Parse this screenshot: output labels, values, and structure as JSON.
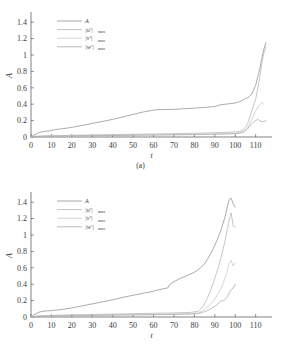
{
  "figure": {
    "panels": [
      {
        "caption": "(a)",
        "xlabel": "t",
        "ylabel": "A"
      },
      {
        "caption": "(b)",
        "xlabel": "t",
        "ylabel": "A"
      }
    ]
  },
  "chart_data": [
    {
      "type": "line",
      "panel": "(a)",
      "title": "",
      "xlabel": "t",
      "ylabel": "A",
      "xlim": [
        0,
        118
      ],
      "ylim": [
        0,
        1.5
      ],
      "xticks": [
        0,
        10,
        20,
        30,
        40,
        50,
        60,
        70,
        80,
        90,
        100,
        110
      ],
      "yticks": [
        0,
        0.2,
        0.4,
        0.6,
        0.8,
        1,
        1.2,
        1.4
      ],
      "xticklabels": [
        "0",
        "10",
        "20",
        "30",
        "40",
        "50",
        "60",
        "70",
        "80",
        "90",
        "100",
        "110"
      ],
      "yticklabels": [
        "0",
        "0.2",
        "0.4",
        "0.6",
        "0.8",
        "1",
        "1.2",
        "1.4"
      ],
      "grid": false,
      "legend_position": "upper-left",
      "series": [
        {
          "name": "A",
          "color": "#8f8f8f",
          "x": [
            0,
            2,
            4,
            6,
            8,
            10,
            12,
            15,
            18,
            20,
            25,
            30,
            35,
            40,
            45,
            50,
            55,
            60,
            62,
            65,
            70,
            75,
            80,
            85,
            90,
            93,
            95,
            97,
            100,
            102,
            104,
            105,
            106,
            108,
            110,
            112,
            113,
            114,
            115
          ],
          "y": [
            0.0,
            0.03,
            0.055,
            0.065,
            0.072,
            0.08,
            0.09,
            0.1,
            0.11,
            0.118,
            0.14,
            0.165,
            0.19,
            0.215,
            0.245,
            0.275,
            0.305,
            0.328,
            0.333,
            0.335,
            0.337,
            0.345,
            0.352,
            0.36,
            0.372,
            0.395,
            0.4,
            0.405,
            0.415,
            0.43,
            0.455,
            0.47,
            0.475,
            0.52,
            0.63,
            0.83,
            0.96,
            1.07,
            1.15
          ]
        },
        {
          "name": "|u'|max",
          "color": "#b4b4b4",
          "x": [
            0,
            2,
            5,
            10,
            15,
            20,
            30,
            40,
            50,
            60,
            70,
            80,
            90,
            95,
            100,
            102,
            104,
            105,
            106,
            108,
            110,
            112,
            113,
            114,
            115
          ],
          "y": [
            0.0,
            0.008,
            0.012,
            0.016,
            0.019,
            0.021,
            0.025,
            0.029,
            0.033,
            0.037,
            0.041,
            0.046,
            0.052,
            0.056,
            0.062,
            0.068,
            0.09,
            0.12,
            0.16,
            0.31,
            0.46,
            0.72,
            0.9,
            1.02,
            1.1
          ]
        },
        {
          "name": "|v'|max",
          "color": "#c8c8c8",
          "x": [
            0,
            2,
            5,
            10,
            15,
            20,
            30,
            40,
            50,
            60,
            70,
            80,
            90,
            95,
            100,
            102,
            104,
            105,
            106,
            108,
            110,
            112,
            113,
            114
          ],
          "y": [
            0.0,
            0.006,
            0.009,
            0.012,
            0.014,
            0.016,
            0.019,
            0.022,
            0.025,
            0.028,
            0.031,
            0.035,
            0.04,
            0.043,
            0.048,
            0.053,
            0.07,
            0.085,
            0.11,
            0.21,
            0.32,
            0.39,
            0.42,
            0.4
          ]
        },
        {
          "name": "|w'|max",
          "color": "#a8a8a8",
          "x": [
            0,
            2,
            5,
            10,
            15,
            20,
            30,
            40,
            50,
            60,
            70,
            80,
            90,
            95,
            100,
            102,
            104,
            105,
            106,
            107,
            108,
            109,
            110,
            111,
            112,
            113,
            114,
            115
          ],
          "y": [
            0.0,
            0.005,
            0.008,
            0.01,
            0.012,
            0.013,
            0.016,
            0.018,
            0.021,
            0.023,
            0.026,
            0.029,
            0.033,
            0.036,
            0.04,
            0.045,
            0.06,
            0.075,
            0.1,
            0.13,
            0.16,
            0.185,
            0.2,
            0.215,
            0.2,
            0.185,
            0.19,
            0.2
          ]
        }
      ]
    },
    {
      "type": "line",
      "panel": "(b)",
      "title": "",
      "xlabel": "t",
      "ylabel": "A",
      "xlim": [
        0,
        118
      ],
      "ylim": [
        0,
        1.5
      ],
      "xticks": [
        0,
        10,
        20,
        30,
        40,
        50,
        60,
        70,
        80,
        90,
        100,
        110
      ],
      "yticks": [
        0,
        0.2,
        0.4,
        0.6,
        0.8,
        1,
        1.2,
        1.4
      ],
      "xticklabels": [
        "0",
        "10",
        "20",
        "30",
        "40",
        "50",
        "60",
        "70",
        "80",
        "90",
        "100",
        "110"
      ],
      "yticklabels": [
        "0",
        "0.2",
        "0.4",
        "0.6",
        "0.8",
        "1",
        "1.2",
        "1.4"
      ],
      "grid": false,
      "legend_position": "upper-left",
      "series": [
        {
          "name": "A",
          "color": "#8f8f8f",
          "x": [
            0,
            2,
            4,
            6,
            8,
            10,
            13,
            16,
            20,
            25,
            30,
            35,
            40,
            45,
            50,
            55,
            60,
            63,
            65,
            67,
            68,
            70,
            73,
            76,
            80,
            83,
            85,
            87,
            89,
            91,
            93,
            95,
            96,
            97,
            98,
            99,
            100
          ],
          "y": [
            0.0,
            0.035,
            0.06,
            0.07,
            0.075,
            0.078,
            0.085,
            0.095,
            0.11,
            0.135,
            0.16,
            0.185,
            0.21,
            0.24,
            0.265,
            0.29,
            0.315,
            0.335,
            0.345,
            0.355,
            0.4,
            0.43,
            0.47,
            0.5,
            0.545,
            0.6,
            0.65,
            0.73,
            0.82,
            0.93,
            1.06,
            1.22,
            1.33,
            1.43,
            1.45,
            1.38,
            1.34
          ]
        },
        {
          "name": "|u'|max",
          "color": "#b4b4b4",
          "x": [
            0,
            3,
            6,
            10,
            15,
            20,
            30,
            40,
            50,
            60,
            70,
            78,
            82,
            84,
            86,
            88,
            90,
            92,
            94,
            95,
            96,
            97,
            98,
            99,
            100
          ],
          "y": [
            0.0,
            0.012,
            0.016,
            0.02,
            0.023,
            0.026,
            0.031,
            0.036,
            0.04,
            0.045,
            0.05,
            0.056,
            0.07,
            0.12,
            0.21,
            0.33,
            0.47,
            0.63,
            0.82,
            0.93,
            1.05,
            1.18,
            1.27,
            1.11,
            1.1
          ]
        },
        {
          "name": "|v'|max",
          "color": "#c8c8c8",
          "x": [
            0,
            3,
            6,
            10,
            15,
            20,
            30,
            40,
            50,
            60,
            70,
            78,
            82,
            84,
            86,
            88,
            90,
            92,
            93,
            94,
            95,
            96,
            97,
            98,
            99,
            100
          ],
          "y": [
            0.0,
            0.009,
            0.012,
            0.015,
            0.018,
            0.02,
            0.024,
            0.027,
            0.031,
            0.034,
            0.038,
            0.043,
            0.05,
            0.075,
            0.11,
            0.16,
            0.22,
            0.3,
            0.34,
            0.41,
            0.47,
            0.56,
            0.66,
            0.69,
            0.62,
            0.66
          ]
        },
        {
          "name": "|w'|max",
          "color": "#a8a8a8",
          "x": [
            0,
            3,
            6,
            10,
            15,
            20,
            30,
            40,
            50,
            60,
            70,
            78,
            82,
            84,
            86,
            88,
            90,
            92,
            93,
            94,
            95,
            96,
            97,
            98,
            99,
            100
          ],
          "y": [
            0.0,
            0.007,
            0.01,
            0.012,
            0.014,
            0.016,
            0.019,
            0.022,
            0.025,
            0.028,
            0.031,
            0.035,
            0.042,
            0.055,
            0.075,
            0.1,
            0.13,
            0.17,
            0.2,
            0.195,
            0.21,
            0.245,
            0.29,
            0.33,
            0.355,
            0.4
          ]
        }
      ]
    }
  ],
  "legend": {
    "entries": [
      {
        "label": "A",
        "sub": "",
        "color": "#8f8f8f"
      },
      {
        "label": "|u'|",
        "sub": "max",
        "color": "#b4b4b4"
      },
      {
        "label": "|v'|",
        "sub": "max",
        "color": "#c8c8c8"
      },
      {
        "label": "|w'|",
        "sub": "max",
        "color": "#a8a8a8"
      }
    ]
  }
}
